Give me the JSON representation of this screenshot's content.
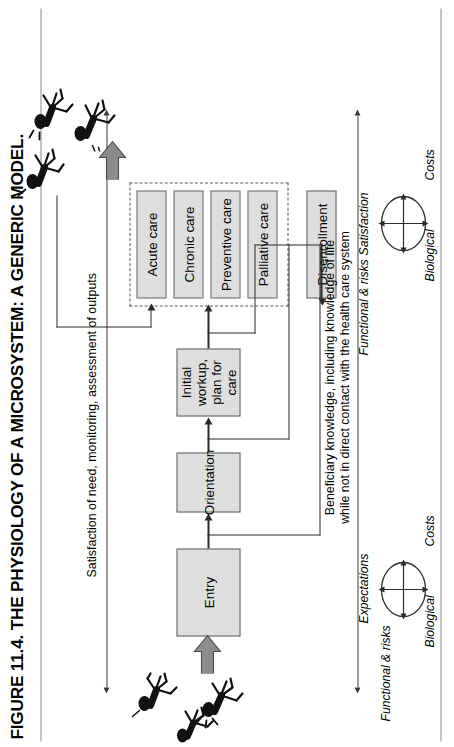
{
  "figure": {
    "title": "FIGURE 11.4.  THE PHYSIOLOGY OF A MICROSYSTEM: A GENERIC MODEL.",
    "orientation": "rotated-90-ccw"
  },
  "annotations": {
    "top_axis_label": "Satisfaction of need, monitoring, assessment of outputs",
    "bottom_axis_label_line1": "Beneficiary knowledge, including knowledge of life",
    "bottom_axis_label_line2": "while not in direct contact with the health care system"
  },
  "flow": {
    "entry": "Entry",
    "orientation_box": "Orientation",
    "initial_workup_line1": "Initial workup,",
    "initial_workup_line2": "plan for care",
    "disenrollment": "Disenrollment"
  },
  "care_group": {
    "items": [
      {
        "label": "Acute care"
      },
      {
        "label": "Chronic care"
      },
      {
        "label": "Preventive care"
      },
      {
        "label": "Palliative care"
      }
    ]
  },
  "circles": {
    "left": {
      "top": "Expectations",
      "right": "Costs",
      "bottom": "Biological",
      "left": "Functional & risks"
    },
    "right": {
      "top": "Satisfaction",
      "right": "Costs",
      "bottom": "Biological",
      "left": "Functional & risks"
    }
  },
  "colors": {
    "box_fill": "#dedede",
    "box_stroke": "#5c5c5c",
    "line": "#2b2b2b",
    "block_arrow": "#8c8c8c",
    "rule": "#8a8a8a"
  },
  "icons": {
    "people_entry": "people-group-icon",
    "people_exit": "people-group-icon",
    "people_loop": "person-icon",
    "block_arrow_in": "block-arrow-icon",
    "block_arrow_out": "block-arrow-icon"
  }
}
